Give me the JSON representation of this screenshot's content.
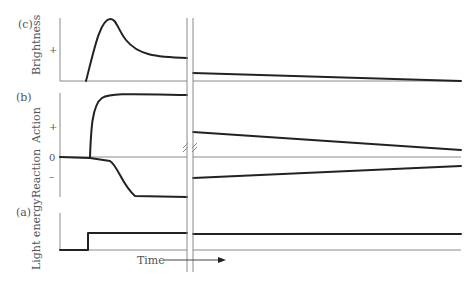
{
  "panels": {
    "c": {
      "tag": "(c)",
      "ylabel": "Brightness",
      "tick": "+"
    },
    "b": {
      "tag": "(b)",
      "ylabel_top": "Action",
      "ylabel_bottom": "Reaction",
      "tick_plus": "+",
      "tick_zero": "0",
      "tick_minus": "–"
    },
    "a": {
      "tag": "(a)",
      "ylabel": "Light energy"
    }
  },
  "xaxis": {
    "label": "Time"
  },
  "colors": {
    "curve": "#222222",
    "axis": "#8a8a8a",
    "text": "#555555"
  }
}
